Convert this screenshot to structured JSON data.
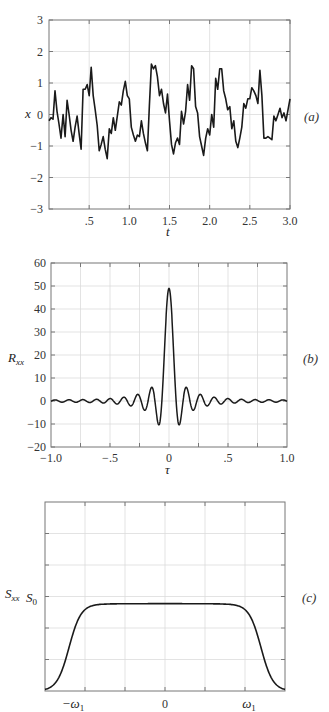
{
  "chart_data": [
    {
      "panel": "(a)",
      "type": "line",
      "title": "",
      "xlabel": "t",
      "ylabel": "x",
      "xlim": [
        0,
        3.0
      ],
      "ylim": [
        -3,
        3
      ],
      "xticks": [
        0.5,
        1.0,
        1.5,
        2.0,
        2.5,
        3.0
      ],
      "xtick_labels": [
        ".5",
        "1.0",
        "1.5",
        "2.0",
        "2.5",
        "3.0"
      ],
      "yticks": [
        -3,
        -2,
        -1,
        0,
        1,
        2,
        3
      ],
      "ytick_labels": [
        "−3",
        "−2",
        "−1",
        "0",
        "1",
        "2",
        "3"
      ],
      "grid": true,
      "series": [
        {
          "name": "x(t)",
          "x": [
            0.0,
            0.02,
            0.04,
            0.06,
            0.08,
            0.1,
            0.12,
            0.14,
            0.16,
            0.18,
            0.2,
            0.22,
            0.24,
            0.26,
            0.28,
            0.3,
            0.32,
            0.34,
            0.36,
            0.38,
            0.4,
            0.42,
            0.44,
            0.46,
            0.48,
            0.5,
            0.52,
            0.54,
            0.56,
            0.58,
            0.6,
            0.62,
            0.64,
            0.66,
            0.68,
            0.7,
            0.72,
            0.74,
            0.76,
            0.78,
            0.8,
            0.82,
            0.84,
            0.86,
            0.88,
            0.9,
            0.92,
            0.94,
            0.96,
            0.98,
            1.0,
            1.02,
            1.04,
            1.06,
            1.08,
            1.1,
            1.12,
            1.14,
            1.16,
            1.18,
            1.2,
            1.22,
            1.24,
            1.26,
            1.28,
            1.3,
            1.32,
            1.34,
            1.36,
            1.38,
            1.4,
            1.42,
            1.44,
            1.46,
            1.48,
            1.5,
            1.52,
            1.54,
            1.56,
            1.58,
            1.6,
            1.62,
            1.64,
            1.66,
            1.68,
            1.7,
            1.72,
            1.74,
            1.76,
            1.78,
            1.8,
            1.82,
            1.84,
            1.86,
            1.88,
            1.9,
            1.92,
            1.94,
            1.96,
            1.98,
            2.0,
            2.02,
            2.04,
            2.06,
            2.08,
            2.1,
            2.12,
            2.14,
            2.16,
            2.18,
            2.2,
            2.22,
            2.24,
            2.26,
            2.28,
            2.3,
            2.32,
            2.34,
            2.36,
            2.38,
            2.4,
            2.42,
            2.44,
            2.46,
            2.48,
            2.5,
            2.52,
            2.54,
            2.56,
            2.58,
            2.6,
            2.62,
            2.64,
            2.66,
            2.68,
            2.7,
            2.72,
            2.74,
            2.76,
            2.78,
            2.8,
            2.82,
            2.84,
            2.86,
            2.88,
            2.9,
            2.92,
            2.94,
            2.96,
            2.98,
            3.0
          ],
          "y": [
            -0.2,
            -0.1,
            -0.15,
            0.75,
            0.1,
            -0.3,
            -0.75,
            0.0,
            -0.7,
            0.45,
            0.0,
            -0.5,
            -0.85,
            -0.4,
            -0.05,
            -0.6,
            -1.1,
            0.8,
            0.8,
            0.95,
            0.6,
            1.5,
            0.6,
            0.15,
            -0.35,
            -1.15,
            -0.95,
            -0.7,
            -1.1,
            -1.4,
            -0.45,
            -0.6,
            -0.1,
            -0.5,
            -0.05,
            0.4,
            0.3,
            0.75,
            1.05,
            0.6,
            0.5,
            -0.4,
            -0.65,
            -0.85,
            -0.65,
            -0.7,
            -0.2,
            -0.6,
            -0.9,
            -1.15,
            0.3,
            1.6,
            1.45,
            1.55,
            1.2,
            0.6,
            0.8,
            0.35,
            0.05,
            0.65,
            -0.2,
            -0.95,
            -1.25,
            -0.9,
            -0.75,
            -0.95,
            0.1,
            -0.3,
            0.1,
            0.95,
            0.45,
            1.55,
            1.45,
            0.25,
            0.05,
            -0.7,
            -1.0,
            -1.3,
            -0.75,
            -0.45,
            -0.65,
            0.0,
            -0.4,
            1.15,
            0.8,
            1.45,
            1.45,
            0.75,
            0.5,
            0.15,
            0.25,
            -0.45,
            -0.2,
            -0.85,
            -1.05,
            -0.75,
            -0.4,
            0.35,
            0.2,
            0.5,
            0.5,
            0.85,
            0.75,
            0.6,
            0.35,
            1.4,
            0.6,
            -0.75,
            -0.75,
            -0.7,
            -0.75,
            -0.8,
            -0.05,
            -0.2,
            0.0,
            0.2,
            -0.1,
            0.05,
            -0.2,
            0.15,
            0.5
          ]
        }
      ]
    },
    {
      "panel": "(b)",
      "type": "line",
      "title": "",
      "xlabel": "τ",
      "ylabel": "R_xx",
      "xlim": [
        -1.0,
        1.0
      ],
      "ylim": [
        -20,
        60
      ],
      "xticks": [
        -1.0,
        -0.5,
        0,
        0.5,
        1.0
      ],
      "xtick_labels": [
        "−1.0",
        "−.5",
        "0",
        ".5",
        "1.0"
      ],
      "yticks": [
        -20,
        -10,
        0,
        10,
        20,
        30,
        40,
        50,
        60
      ],
      "ytick_labels": [
        "−20",
        "−10",
        "0",
        "10",
        "20",
        "30",
        "40",
        "50",
        "60"
      ],
      "grid": true,
      "series": [
        {
          "name": "R_xx(τ)",
          "description": "sinc-like autocorrelation; peak 49 at τ=0, first minima ≈ −10.5 at τ≈±0.09, side lobes ≈ 6 at ±0.15, 3.5 at ±0.27, 2.5 at ±0.39 decaying to ≈ 1 near ±1",
          "peak": 49,
          "x": [
            -1.0,
            -0.95,
            -0.9,
            -0.85,
            -0.8,
            -0.75,
            -0.7,
            -0.65,
            -0.6,
            -0.55,
            -0.5,
            -0.45,
            -0.4,
            -0.35,
            -0.3,
            -0.27,
            -0.21,
            -0.15,
            -0.09,
            -0.05,
            0.0,
            0.05,
            0.09,
            0.15,
            0.21,
            0.27,
            0.3,
            0.35,
            0.4,
            0.45,
            0.5,
            0.55,
            0.6,
            0.65,
            0.7,
            0.75,
            0.8,
            0.85,
            0.9,
            0.95,
            1.0
          ],
          "y": [
            -0.5,
            1.5,
            -1,
            1.5,
            -1.2,
            1.5,
            -1.5,
            1.8,
            -1.5,
            2,
            -1.8,
            2.3,
            -2,
            2.5,
            -3,
            3.5,
            -4.5,
            6,
            -10.5,
            10,
            49,
            10,
            -10.5,
            6,
            -4.5,
            3.5,
            -3,
            2.5,
            -2,
            2.3,
            -1.8,
            2,
            -1.5,
            1.8,
            -1.5,
            1.5,
            -1.2,
            1.5,
            -1,
            1.2,
            -0.8
          ]
        }
      ]
    },
    {
      "panel": "(c)",
      "type": "line",
      "title": "",
      "xlabel": "",
      "ylabel": "S_xx",
      "xticks_named": [
        "−ω₁",
        "0",
        "ω₁"
      ],
      "ytick_named": "S₀",
      "grid": true,
      "series": [
        {
          "name": "S_xx(ω)",
          "description": "band-limited flat spectrum: plateau ≈ S0 (slightly below) for |ω| < ω₁, smooth roll-off to 0 beyond ω₁",
          "x_norm": [
            -1.5,
            -1.4,
            -1.3,
            -1.2,
            -1.1,
            -1.0,
            -0.9,
            -0.8,
            0.0,
            0.8,
            0.9,
            1.0,
            1.1,
            1.2,
            1.3,
            1.4,
            1.5
          ],
          "y_rel_S0": [
            0.0,
            0.04,
            0.18,
            0.45,
            0.75,
            0.93,
            0.98,
            0.99,
            0.99,
            0.99,
            0.98,
            0.93,
            0.75,
            0.45,
            0.18,
            0.04,
            0.0
          ]
        }
      ]
    }
  ],
  "panels": {
    "a": {
      "label": "(a)",
      "ylabel": "x",
      "xlabel": "t"
    },
    "b": {
      "label": "(b)",
      "ylabel_main": "R",
      "ylabel_sub": "xx",
      "xlabel": "τ"
    },
    "c": {
      "label": "(c)",
      "ylabel_main": "S",
      "ylabel_sub": "xx",
      "s0_main": "S",
      "s0_sub": "0",
      "xtick_neg": "−ω",
      "xtick_pos": "ω",
      "xtick_sub": "1",
      "xtick_zero": "0"
    }
  },
  "colors": {
    "line": "#1a1a1a",
    "grid": "#dcdcdc",
    "frame": "#777777",
    "text": "#333333"
  }
}
